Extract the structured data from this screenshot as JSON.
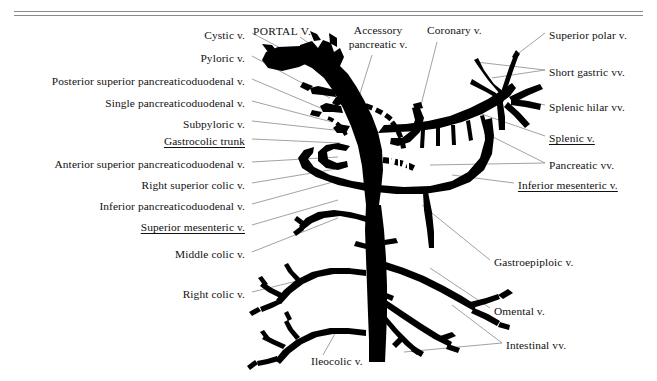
{
  "figure": {
    "type": "anatomical-diagram",
    "background_color": "#ffffff",
    "vessel_color": "#000000",
    "leader_color": "#8a8a8a",
    "rule_color": "#8a8a8a",
    "width": 657,
    "height": 381
  },
  "labels_left": [
    {
      "text": "Cystic v.",
      "x": 245,
      "y": 35,
      "underline": false
    },
    {
      "text": "Pyloric v.",
      "x": 245,
      "y": 58,
      "underline": false
    },
    {
      "text": "Posterior superior pancreaticoduodenal v.",
      "x": 245,
      "y": 81,
      "underline": false
    },
    {
      "text": "Single pancreaticoduodenal v.",
      "x": 245,
      "y": 104,
      "underline": false
    },
    {
      "text": "Subpyloric v.",
      "x": 245,
      "y": 124,
      "underline": false
    },
    {
      "text": "Gastrocolic trunk",
      "x": 245,
      "y": 141,
      "underline": true
    },
    {
      "text": "Anterior superior pancreaticoduodenal v.",
      "x": 245,
      "y": 165,
      "underline": false
    },
    {
      "text": "Right superior colic  v.",
      "x": 245,
      "y": 186,
      "underline": false
    },
    {
      "text": "Inferior pancreaticoduodenal v.",
      "x": 245,
      "y": 207,
      "underline": false
    },
    {
      "text": "Superior mesenteric v.",
      "x": 245,
      "y": 228,
      "underline": true
    },
    {
      "text": "Middle colic v.",
      "x": 245,
      "y": 255,
      "underline": false
    },
    {
      "text": "Right colic v.",
      "x": 245,
      "y": 295,
      "underline": false
    }
  ],
  "labels_right": [
    {
      "text": "Superior polar v.",
      "x": 549,
      "y": 35,
      "underline": false
    },
    {
      "text": "Short gastric vv.",
      "x": 549,
      "y": 72,
      "underline": false
    },
    {
      "text": "Splenic hilar vv.",
      "x": 549,
      "y": 107,
      "underline": false
    },
    {
      "text": "Splenic v.",
      "x": 549,
      "y": 138,
      "underline": true
    },
    {
      "text": "Pancreatic vv.",
      "x": 549,
      "y": 165,
      "underline": false
    },
    {
      "text": "Inferior mesenteric v.",
      "x": 518,
      "y": 185,
      "underline": true
    },
    {
      "text": "Gastroepiploic v.",
      "x": 494,
      "y": 262,
      "underline": false
    },
    {
      "text": "Omental v.",
      "x": 494,
      "y": 311,
      "underline": false
    },
    {
      "text": "Intestinal vv.",
      "x": 506,
      "y": 345,
      "underline": false
    }
  ],
  "labels_top": [
    {
      "text": "PORTAL V.",
      "x": 253,
      "y": 30,
      "caps": true,
      "multiline": false
    },
    {
      "text": "Accessory pancreatic v.",
      "x": 345,
      "y": 28,
      "caps": false,
      "multiline": true
    },
    {
      "text": "Coronary v.",
      "x": 427,
      "y": 28,
      "caps": false,
      "multiline": false
    }
  ],
  "labels_bottom": [
    {
      "text": "Ileocolic v.",
      "x": 311,
      "y": 361,
      "underline": false
    }
  ]
}
